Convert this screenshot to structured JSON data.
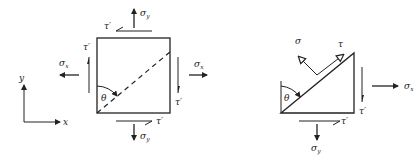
{
  "figure": {
    "left_panel": {
      "description": "Square stress element with normal and shear stresses, dashed diagonal inclined plane at angle theta",
      "labels": {
        "sigma_y_top": "σ",
        "sigma_y_top_sub": "y",
        "sigma_y_bottom": "σ",
        "sigma_y_bottom_sub": "y",
        "sigma_x_left": "σ",
        "sigma_x_left_sub": "x",
        "sigma_x_right": "σ",
        "sigma_x_right_sub": "x",
        "tau_top": "τ′",
        "tau_left": "τ′",
        "tau_right": "τ′",
        "tau_bottom": "τ′",
        "theta": "θ"
      },
      "axes": {
        "x_label": "x",
        "y_label": "y"
      }
    },
    "right_panel": {
      "description": "Triangular free-body wedge cut along inclined plane showing normal stress sigma and shear stress tau",
      "labels": {
        "sigma": "σ",
        "tau": "τ",
        "theta": "θ",
        "sigma_x": "σ",
        "sigma_x_sub": "x",
        "sigma_y": "σ",
        "sigma_y_sub": "y",
        "tau_right": "τ′",
        "tau_bottom": "τ′"
      }
    },
    "colors": {
      "ink": "#222222",
      "background": "#ffffff"
    }
  }
}
